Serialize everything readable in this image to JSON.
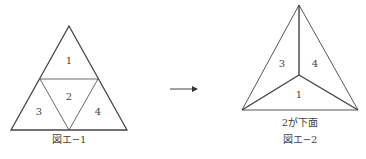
{
  "figure1": {
    "caption": "図エ−1",
    "faces": [
      {
        "id": "1",
        "label": "1"
      },
      {
        "id": "2",
        "label": "2"
      },
      {
        "id": "3",
        "label": "3"
      },
      {
        "id": "4",
        "label": "4"
      }
    ]
  },
  "figure2": {
    "note": "2が下面",
    "caption": "図エ−2",
    "faces": [
      {
        "id": "3",
        "label": "3"
      },
      {
        "id": "4",
        "label": "4"
      },
      {
        "id": "1",
        "label": "1"
      }
    ]
  },
  "arrow": {
    "direction": "right"
  },
  "colors": {
    "line": "#444444",
    "background": "#ffffff"
  }
}
